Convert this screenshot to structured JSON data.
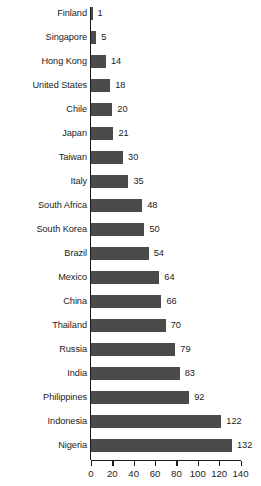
{
  "chart_data": {
    "type": "bar",
    "orientation": "horizontal",
    "title": "",
    "subtitle": "",
    "xlabel": "",
    "ylabel": "",
    "grid": false,
    "legend": null,
    "xlim": [
      0,
      140
    ],
    "xticks": [
      0,
      20,
      40,
      60,
      80,
      100,
      120,
      140
    ],
    "xtick_labels": [
      "0",
      "20",
      "40",
      "60",
      "80",
      "100",
      "120",
      "140"
    ],
    "bar_color": "#4b4b4b",
    "axis_color": "#1b1b1b",
    "background_color": "#ffffff",
    "categories": [
      "Finland",
      "Singapore",
      "Hong Kong",
      "United States",
      "Chile",
      "Japan",
      "Taiwan",
      "Italy",
      "South Africa",
      "South Korea",
      "Brazil",
      "Mexico",
      "China",
      "Thailand",
      "Russia",
      "India",
      "Philippines",
      "Indonesia",
      "Nigeria"
    ],
    "values": [
      1,
      5,
      14,
      18,
      20,
      21,
      30,
      35,
      48,
      50,
      54,
      64,
      66,
      70,
      79,
      83,
      92,
      122,
      132
    ],
    "value_labels": [
      "1",
      "5",
      "14",
      "18",
      "20",
      "21",
      "30",
      "35",
      "48",
      "50",
      "54",
      "64",
      "66",
      "70",
      "79",
      "83",
      "92",
      "122",
      "132"
    ]
  }
}
